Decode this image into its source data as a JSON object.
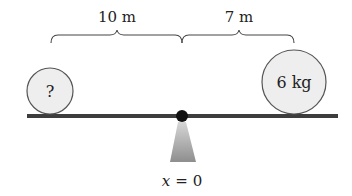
{
  "diagram": {
    "type": "seesaw-balance",
    "distances": {
      "left": {
        "label": "10 m",
        "value": 10,
        "unit": "m"
      },
      "right": {
        "label": "7 m",
        "value": 7,
        "unit": "m"
      }
    },
    "masses": {
      "left": {
        "label": "?"
      },
      "right": {
        "label": "6 kg",
        "value": 6,
        "unit": "kg"
      }
    },
    "pivot": {
      "label_var": "x",
      "label_eq": "=",
      "label_val": "0"
    },
    "colors": {
      "beam": "#3d3d3d",
      "pivot": "#111111",
      "ball_fill": "#eeeeee",
      "ball_stroke": "#555555",
      "support": "#9a9a9a",
      "brace": "#444444"
    }
  }
}
